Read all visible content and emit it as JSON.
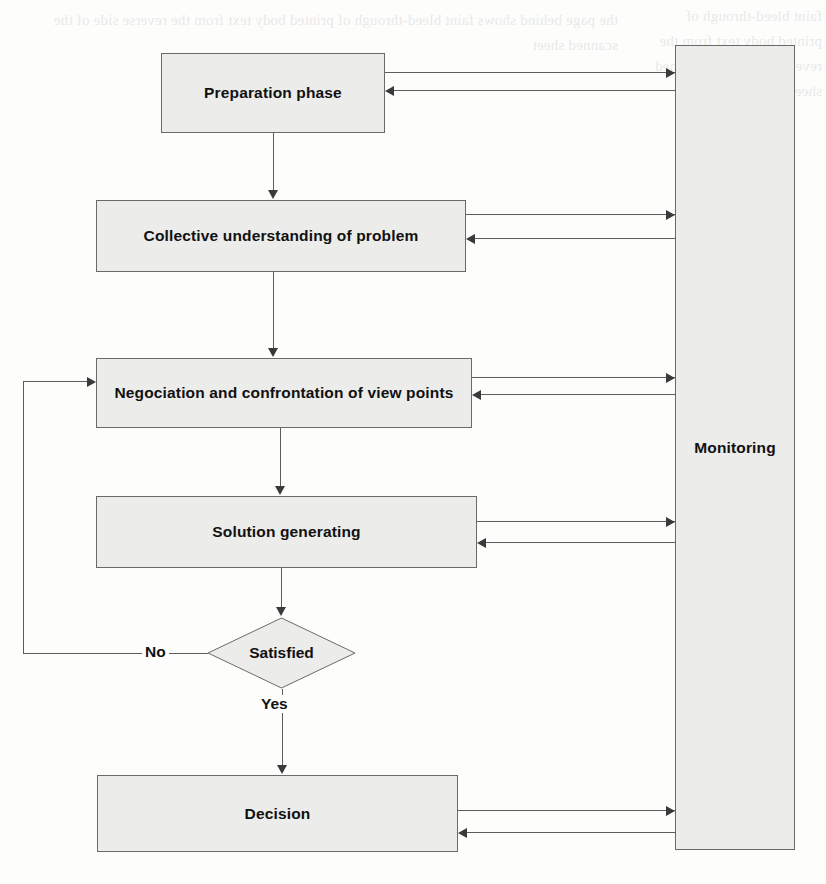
{
  "diagram": {
    "type": "flowchart",
    "nodes": [
      {
        "id": "preparation",
        "label": "Preparation phase",
        "shape": "process"
      },
      {
        "id": "collective",
        "label": "Collective understanding of problem",
        "shape": "process"
      },
      {
        "id": "negociation",
        "label": "Negociation and confrontation of view points",
        "shape": "process"
      },
      {
        "id": "solution",
        "label": "Solution generating",
        "shape": "process"
      },
      {
        "id": "satisfied",
        "label": "Satisfied",
        "shape": "decision"
      },
      {
        "id": "decision",
        "label": "Decision",
        "shape": "process"
      },
      {
        "id": "monitoring",
        "label": "Monitoring",
        "shape": "process"
      }
    ],
    "edge_labels": {
      "no": "No",
      "yes": "Yes"
    },
    "edges": [
      {
        "from": "preparation",
        "to": "collective",
        "label": ""
      },
      {
        "from": "collective",
        "to": "negociation",
        "label": ""
      },
      {
        "from": "negociation",
        "to": "solution",
        "label": ""
      },
      {
        "from": "solution",
        "to": "satisfied",
        "label": ""
      },
      {
        "from": "satisfied",
        "to": "negociation",
        "label": "No"
      },
      {
        "from": "satisfied",
        "to": "decision",
        "label": "Yes"
      },
      {
        "from": "preparation",
        "to": "monitoring",
        "label": "",
        "bidirectional": true
      },
      {
        "from": "collective",
        "to": "monitoring",
        "label": "",
        "bidirectional": true
      },
      {
        "from": "negociation",
        "to": "monitoring",
        "label": "",
        "bidirectional": true
      },
      {
        "from": "solution",
        "to": "monitoring",
        "label": "",
        "bidirectional": true
      },
      {
        "from": "decision",
        "to": "monitoring",
        "label": "",
        "bidirectional": true
      }
    ],
    "colors": {
      "node_fill": "#ececeb",
      "node_stroke": "#6a6a6a",
      "line": "#5d5d5d",
      "arrow": "#3a3a3a",
      "text": "#111111",
      "page_background": "#fdfdfc"
    }
  },
  "background_text": {
    "left_column": "the page behind shows faint bleed-through of printed body text from the reverse side of the scanned sheet",
    "right_column": "faint bleed-through of printed body text from the reverse side of the scanned sheet"
  }
}
